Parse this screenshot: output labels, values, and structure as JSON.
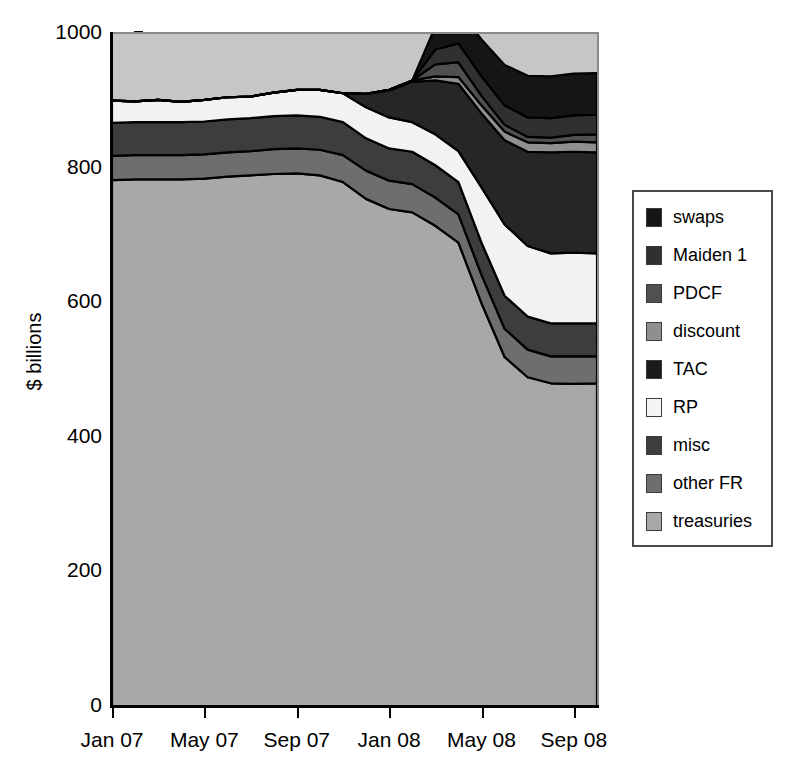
{
  "chart_data": {
    "type": "area",
    "stacked": true,
    "title": "",
    "xlabel": "",
    "ylabel": "$ billions",
    "ylim": [
      0,
      1000
    ],
    "yticks": [
      0,
      200,
      400,
      600,
      800,
      1000
    ],
    "ytick_labels": [
      "0",
      "200",
      "400",
      "600",
      "800",
      "1000"
    ],
    "grid": false,
    "legend_position": "right",
    "plot_background": "#c6c6c6",
    "x": [
      "Jan 07",
      "Feb 07",
      "Mar 07",
      "Apr 07",
      "May 07",
      "Jun 07",
      "Jul 07",
      "Aug 07",
      "Sep 07",
      "Oct 07",
      "Nov 07",
      "Dec 07",
      "Jan 08",
      "Feb 08",
      "Mar 08",
      "Apr 08",
      "May 08",
      "Jun 08",
      "Jul 08",
      "Aug 08",
      "Sep 08",
      "Oct 08"
    ],
    "xtick_labels": [
      "Jan 07",
      "May 07",
      "Sep 07",
      "Jan 08",
      "May 08",
      "Sep 08"
    ],
    "xtick_positions": [
      0,
      4,
      8,
      12,
      16,
      20
    ],
    "series": [
      {
        "name": "treasuries",
        "color": "#a8a8a8",
        "values": [
          783,
          784,
          784,
          784,
          785,
          788,
          790,
          792,
          793,
          790,
          780,
          755,
          740,
          735,
          715,
          690,
          600,
          520,
          490,
          481,
          480,
          481
        ]
      },
      {
        "name": "other FR",
        "color": "#6e6e6e",
        "values": [
          36,
          36,
          36,
          36,
          36,
          36,
          36,
          37,
          37,
          38,
          40,
          42,
          42,
          42,
          42,
          42,
          42,
          42,
          41,
          40,
          41,
          40
        ]
      },
      {
        "name": "misc",
        "color": "#3d3d3d",
        "values": [
          49,
          49,
          49,
          49,
          49,
          49,
          49,
          49,
          49,
          49,
          49,
          48,
          48,
          48,
          48,
          48,
          48,
          49,
          49,
          49,
          49,
          49
        ]
      },
      {
        "name": "RP",
        "color": "#f2f2f2",
        "values": [
          33,
          31,
          33,
          30,
          32,
          33,
          32,
          35,
          38,
          40,
          43,
          46,
          46,
          44,
          46,
          46,
          82,
          106,
          105,
          104,
          105,
          104
        ]
      },
      {
        "name": "TAC",
        "color": "#262626",
        "values": [
          0,
          0,
          0,
          0,
          0,
          0,
          0,
          0,
          0,
          0,
          0,
          20,
          40,
          60,
          80,
          100,
          110,
          125,
          140,
          150,
          150,
          150
        ]
      },
      {
        "name": "discount",
        "color": "#8f8f8f",
        "values": [
          0,
          0,
          0,
          0,
          0,
          0,
          0,
          0,
          0,
          0,
          0,
          0,
          1,
          2,
          6,
          10,
          12,
          13,
          14,
          14,
          15,
          15
        ]
      },
      {
        "name": "PDCF",
        "color": "#505050",
        "values": [
          0,
          0,
          0,
          0,
          0,
          0,
          0,
          0,
          0,
          0,
          0,
          0,
          0,
          0,
          18,
          22,
          14,
          10,
          8,
          8,
          10,
          12
        ]
      },
      {
        "name": "Maiden 1",
        "color": "#303030",
        "values": [
          0,
          0,
          0,
          0,
          0,
          0,
          0,
          0,
          0,
          0,
          0,
          0,
          0,
          0,
          22,
          28,
          29,
          29,
          29,
          29,
          29,
          29
        ]
      },
      {
        "name": "swaps",
        "color": "#151515",
        "values": [
          0,
          0,
          0,
          0,
          0,
          0,
          0,
          0,
          0,
          0,
          0,
          0,
          0,
          0,
          34,
          50,
          55,
          60,
          62,
          62,
          62,
          62
        ]
      }
    ],
    "legend_order": [
      "swaps",
      "Maiden 1",
      "PDCF",
      "discount",
      "TAC",
      "RP",
      "misc",
      "other FR",
      "treasuries"
    ]
  },
  "legend": {
    "items": [
      {
        "label": "swaps",
        "color": "#151515"
      },
      {
        "label": "Maiden 1",
        "color": "#303030"
      },
      {
        "label": "PDCF",
        "color": "#505050"
      },
      {
        "label": "discount",
        "color": "#8f8f8f"
      },
      {
        "label": "TAC",
        "color": "#1a1a1a"
      },
      {
        "label": "RP",
        "color": "#f5f5f5"
      },
      {
        "label": "misc",
        "color": "#3d3d3d"
      },
      {
        "label": "other FR",
        "color": "#6e6e6e"
      },
      {
        "label": "treasuries",
        "color": "#a8a8a8"
      }
    ]
  },
  "axes": {
    "y_title": "$ billions",
    "y_tick_labels": [
      "1000",
      "800",
      "600",
      "400",
      "200",
      "0"
    ],
    "x_tick_labels": [
      "Jan 07",
      "May 07",
      "Sep 07",
      "Jan 08",
      "May 08",
      "Sep 08"
    ]
  }
}
